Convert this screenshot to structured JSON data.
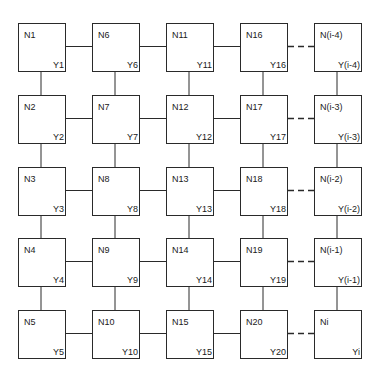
{
  "diagram": {
    "title": "",
    "columns": 5,
    "rows": 5,
    "nodes": [
      {
        "id": "N1",
        "y": "Y1",
        "col": 0,
        "row": 0
      },
      {
        "id": "N2",
        "y": "Y2",
        "col": 0,
        "row": 1
      },
      {
        "id": "N3",
        "y": "Y3",
        "col": 0,
        "row": 2
      },
      {
        "id": "N4",
        "y": "Y4",
        "col": 0,
        "row": 3
      },
      {
        "id": "N5",
        "y": "Y5",
        "col": 0,
        "row": 4
      },
      {
        "id": "N6",
        "y": "Y6",
        "col": 1,
        "row": 0
      },
      {
        "id": "N7",
        "y": "Y7",
        "col": 1,
        "row": 1
      },
      {
        "id": "N8",
        "y": "Y8",
        "col": 1,
        "row": 2
      },
      {
        "id": "N9",
        "y": "Y9",
        "col": 1,
        "row": 3
      },
      {
        "id": "N10",
        "y": "Y10",
        "col": 1,
        "row": 4
      },
      {
        "id": "N11",
        "y": "Y11",
        "col": 2,
        "row": 0
      },
      {
        "id": "N12",
        "y": "Y12",
        "col": 2,
        "row": 1
      },
      {
        "id": "N13",
        "y": "Y13",
        "col": 2,
        "row": 2
      },
      {
        "id": "N14",
        "y": "Y14",
        "col": 2,
        "row": 3
      },
      {
        "id": "N15",
        "y": "Y15",
        "col": 2,
        "row": 4
      },
      {
        "id": "N16",
        "y": "Y16",
        "col": 3,
        "row": 0
      },
      {
        "id": "N17",
        "y": "Y17",
        "col": 3,
        "row": 1
      },
      {
        "id": "N18",
        "y": "Y18",
        "col": 3,
        "row": 2
      },
      {
        "id": "N19",
        "y": "Y19",
        "col": 3,
        "row": 3
      },
      {
        "id": "N20",
        "y": "Y20",
        "col": 3,
        "row": 4
      },
      {
        "id": "N(i-4)",
        "y": "Y(i-4)",
        "col": 4,
        "row": 0
      },
      {
        "id": "N(i-3)",
        "y": "Y(i-3)",
        "col": 4,
        "row": 1
      },
      {
        "id": "N(i-2)",
        "y": "Y(i-2)",
        "col": 4,
        "row": 2
      },
      {
        "id": "N(i-1)",
        "y": "Y(i-1)",
        "col": 4,
        "row": 3
      },
      {
        "id": "Ni",
        "y": "Yi",
        "col": 4,
        "row": 4
      }
    ],
    "edges": {
      "vertical": "solid links between vertically adjacent nodes in every column",
      "horizontal_solid": "between columns 1-2, 2-3, 3-4",
      "horizontal_dashed": "between columns 4-5 (N16..N20 to N(i-4)..Ni)"
    },
    "colors": {
      "line": "#2a2a2a",
      "background": "#ffffff"
    }
  }
}
